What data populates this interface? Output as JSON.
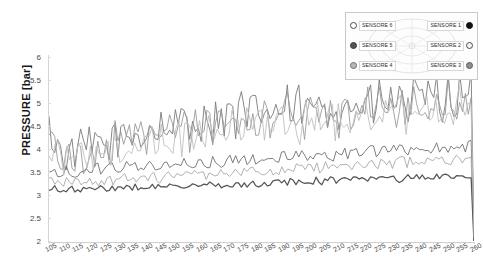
{
  "chart_data": {
    "type": "line",
    "title": "",
    "xlabel": "",
    "ylabel": "PRESSURE [bar]",
    "ylim": [
      2,
      6
    ],
    "xlim": [
      105,
      260
    ],
    "grid": false,
    "legend_position": "top-right",
    "ytick_labels": [
      "6",
      "5.5",
      "5",
      "4.5",
      "4",
      "3.5",
      "3",
      "2.5",
      "2"
    ],
    "ytick_values": [
      6,
      5.5,
      5,
      4.5,
      4,
      3.5,
      3,
      2.5,
      2
    ],
    "xtick_labels": [
      "105",
      "110",
      "115",
      "120",
      "125",
      "130",
      "135",
      "140",
      "145",
      "150",
      "155",
      "160",
      "165",
      "170",
      "175",
      "180",
      "185",
      "190",
      "195",
      "200",
      "205",
      "210",
      "215",
      "220",
      "225",
      "230",
      "235",
      "240",
      "245",
      "250",
      "255",
      "260"
    ],
    "xtick_values": [
      105,
      110,
      115,
      120,
      125,
      130,
      135,
      140,
      145,
      150,
      155,
      160,
      165,
      170,
      175,
      180,
      185,
      190,
      195,
      200,
      205,
      210,
      215,
      220,
      225,
      230,
      235,
      240,
      245,
      250,
      255,
      260
    ],
    "series": [
      {
        "name": "SENSORE 1",
        "color": "#7a7a7a",
        "marker": "filled-circle-black",
        "values": [
          4.42,
          4.3,
          4.18,
          4.05,
          3.96,
          3.9,
          3.86,
          3.84,
          3.88,
          3.96,
          4.06,
          4.02,
          3.94,
          4.0,
          4.12,
          4.04,
          3.96,
          4.06,
          4.18,
          4.1,
          3.98,
          4.06,
          4.2,
          4.34,
          4.22,
          4.1,
          4.24,
          4.4,
          4.3,
          4.16,
          4.28,
          4.46,
          4.34,
          4.2,
          4.36,
          4.52,
          4.4,
          4.26,
          4.42,
          4.58,
          4.44,
          4.3,
          4.48,
          4.64,
          4.5,
          4.36,
          4.54,
          4.7,
          4.56,
          4.4,
          4.58,
          4.76,
          4.62,
          4.46,
          4.64,
          4.82,
          4.66,
          4.5,
          4.68,
          4.86,
          4.7,
          4.54,
          4.72,
          4.9,
          4.74,
          4.56,
          4.74,
          4.92,
          4.76,
          4.58,
          4.76,
          4.94,
          4.78,
          4.6,
          4.78,
          4.96,
          4.8,
          4.62,
          4.8,
          4.98,
          4.82,
          4.64,
          4.82,
          5.0,
          4.84,
          4.66,
          4.84,
          5.02,
          4.86,
          4.68,
          4.86,
          5.04,
          4.88,
          4.7,
          4.88,
          5.06,
          4.9,
          4.72,
          4.9,
          5.08,
          4.92,
          4.74,
          4.92,
          5.1,
          4.94,
          4.76,
          4.94,
          5.12,
          4.96,
          4.78,
          4.96,
          5.14,
          4.98,
          4.8,
          4.98,
          5.16,
          5.0,
          4.82,
          5.0,
          5.18,
          5.02,
          4.84,
          5.02,
          5.2,
          5.04,
          4.86,
          5.04,
          5.22,
          5.06,
          4.88,
          5.06,
          5.24,
          5.08,
          4.9,
          5.08,
          5.26,
          5.1,
          4.92,
          5.1,
          5.28,
          5.12,
          4.94,
          5.12,
          5.3,
          5.14,
          4.96,
          5.14,
          5.32,
          2.05
        ]
      },
      {
        "name": "SENSORE 2",
        "color": "#9b9b9b",
        "marker": "open-circle",
        "values": [
          4.3,
          4.18,
          4.06,
          3.95,
          3.86,
          3.8,
          3.78,
          3.76,
          3.8,
          3.88,
          3.96,
          3.92,
          3.86,
          3.92,
          4.02,
          3.96,
          3.88,
          3.98,
          4.08,
          4.0,
          3.9,
          3.98,
          4.1,
          4.22,
          4.12,
          4.0,
          4.14,
          4.28,
          4.18,
          4.06,
          4.18,
          4.34,
          4.22,
          4.1,
          4.24,
          4.4,
          4.28,
          4.14,
          4.3,
          4.46,
          4.32,
          4.18,
          4.36,
          4.52,
          4.38,
          4.24,
          4.42,
          4.58,
          4.44,
          4.28,
          4.46,
          4.64,
          4.5,
          4.34,
          4.52,
          4.7,
          4.54,
          4.38,
          4.56,
          4.74,
          4.58,
          4.42,
          4.6,
          4.78,
          4.62,
          4.44,
          4.62,
          4.8,
          4.64,
          4.46,
          4.64,
          4.82,
          4.66,
          4.48,
          4.66,
          4.84,
          4.68,
          4.5,
          4.68,
          4.86,
          4.7,
          4.52,
          4.7,
          4.88,
          4.72,
          4.54,
          4.72,
          4.9,
          4.74,
          4.56,
          4.74,
          4.92,
          4.76,
          4.58,
          4.76,
          4.94,
          4.78,
          4.6,
          4.78,
          4.96,
          4.8,
          4.62,
          4.8,
          4.98,
          4.82,
          4.64,
          4.82,
          5.0,
          4.84,
          4.66,
          4.84,
          5.02,
          4.86,
          4.68,
          4.86,
          5.04,
          4.88,
          4.7,
          4.88,
          5.06,
          4.9,
          4.72,
          4.9,
          5.08,
          4.92,
          4.74,
          4.92,
          5.1,
          4.94,
          4.76,
          4.94,
          5.12,
          4.96,
          4.78,
          4.96,
          5.14,
          4.98,
          4.8,
          4.98,
          5.16,
          5.0,
          4.82,
          5.0,
          5.18,
          5.02,
          4.84,
          5.02,
          5.2,
          2.02
        ]
      },
      {
        "name": "SENSORE 3",
        "color": "#6f6f6f",
        "marker": "grey-circle",
        "values": [
          3.58,
          3.56,
          3.54,
          3.52,
          3.5,
          3.5,
          3.52,
          3.54,
          3.52,
          3.5,
          3.52,
          3.54,
          3.56,
          3.54,
          3.52,
          3.54,
          3.56,
          3.58,
          3.56,
          3.54,
          3.56,
          3.58,
          3.6,
          3.58,
          3.56,
          3.58,
          3.6,
          3.62,
          3.6,
          3.58,
          3.6,
          3.62,
          3.64,
          3.62,
          3.6,
          3.62,
          3.64,
          3.66,
          3.64,
          3.62,
          3.64,
          3.66,
          3.68,
          3.66,
          3.64,
          3.66,
          3.68,
          3.7,
          3.68,
          3.66,
          3.68,
          3.7,
          3.72,
          3.7,
          3.68,
          3.7,
          3.72,
          3.74,
          3.72,
          3.7,
          3.72,
          3.74,
          3.76,
          3.74,
          3.72,
          3.74,
          3.76,
          3.78,
          3.76,
          3.74,
          3.76,
          3.78,
          3.8,
          3.78,
          3.76,
          3.78,
          3.8,
          3.82,
          3.8,
          3.78,
          3.8,
          3.82,
          3.84,
          3.82,
          3.8,
          3.82,
          3.84,
          3.86,
          3.84,
          3.82,
          3.84,
          3.86,
          3.88,
          3.86,
          3.84,
          3.86,
          3.88,
          3.9,
          3.88,
          3.86,
          3.88,
          3.9,
          3.92,
          3.9,
          3.88,
          3.9,
          3.92,
          3.94,
          3.92,
          3.9,
          3.92,
          3.94,
          3.96,
          3.94,
          3.92,
          3.94,
          3.96,
          3.98,
          3.96,
          3.94,
          3.96,
          3.98,
          4.0,
          3.98,
          3.96,
          3.98,
          4.0,
          4.02,
          4.0,
          3.98,
          4.0,
          4.02,
          4.04,
          4.02,
          4.0,
          4.02,
          4.04,
          4.06,
          4.04,
          4.02,
          4.04,
          4.06,
          4.08,
          4.06,
          4.04,
          4.06,
          4.08,
          4.1,
          2.0
        ]
      },
      {
        "name": "SENSORE 4",
        "color": "#a8a8a8",
        "marker": "grey-circle",
        "values": [
          3.3,
          3.28,
          3.26,
          3.24,
          3.24,
          3.26,
          3.28,
          3.26,
          3.24,
          3.26,
          3.28,
          3.3,
          3.28,
          3.26,
          3.28,
          3.3,
          3.32,
          3.3,
          3.28,
          3.3,
          3.32,
          3.34,
          3.32,
          3.3,
          3.32,
          3.34,
          3.36,
          3.34,
          3.32,
          3.34,
          3.36,
          3.38,
          3.36,
          3.34,
          3.36,
          3.38,
          3.4,
          3.38,
          3.36,
          3.38,
          3.4,
          3.42,
          3.4,
          3.38,
          3.4,
          3.42,
          3.44,
          3.42,
          3.4,
          3.42,
          3.44,
          3.46,
          3.44,
          3.42,
          3.44,
          3.46,
          3.48,
          3.46,
          3.44,
          3.46,
          3.48,
          3.5,
          3.48,
          3.46,
          3.48,
          3.5,
          3.52,
          3.5,
          3.48,
          3.5,
          3.52,
          3.54,
          3.52,
          3.5,
          3.52,
          3.54,
          3.56,
          3.54,
          3.52,
          3.54,
          3.56,
          3.58,
          3.56,
          3.54,
          3.56,
          3.58,
          3.6,
          3.58,
          3.56,
          3.58,
          3.6,
          3.62,
          3.6,
          3.58,
          3.6,
          3.62,
          3.64,
          3.62,
          3.6,
          3.62,
          3.64,
          3.66,
          3.64,
          3.62,
          3.64,
          3.66,
          3.68,
          3.66,
          3.64,
          3.66,
          3.68,
          3.7,
          3.68,
          3.66,
          3.68,
          3.7,
          3.72,
          3.7,
          3.68,
          3.7,
          3.72,
          3.74,
          3.72,
          3.7,
          3.72,
          3.74,
          3.76,
          3.74,
          3.72,
          3.74,
          3.76,
          3.78,
          3.76,
          3.74,
          3.76,
          3.78,
          3.8,
          3.78,
          3.76,
          3.78,
          3.8,
          3.82,
          3.8,
          3.78,
          3.8,
          3.82,
          1.98
        ]
      },
      {
        "name": "SENSORE 5",
        "color": "#555555",
        "marker": "filled-dark-circle",
        "values": [
          3.1,
          3.12,
          3.14,
          3.12,
          3.1,
          3.08,
          3.1,
          3.12,
          3.14,
          3.12,
          3.1,
          3.12,
          3.14,
          3.12,
          3.1,
          3.12,
          3.14,
          3.16,
          3.14,
          3.12,
          3.14,
          3.16,
          3.14,
          3.12,
          3.14,
          3.16,
          3.18,
          3.16,
          3.14,
          3.16,
          3.18,
          3.16,
          3.14,
          3.16,
          3.18,
          3.2,
          3.18,
          3.16,
          3.18,
          3.2,
          3.18,
          3.16,
          3.18,
          3.2,
          3.22,
          3.2,
          3.18,
          3.2,
          3.22,
          3.2,
          3.18,
          3.2,
          3.22,
          3.24,
          3.22,
          3.2,
          3.22,
          3.24,
          3.22,
          3.2,
          3.22,
          3.24,
          3.26,
          3.24,
          3.22,
          3.24,
          3.26,
          3.24,
          3.22,
          3.24,
          3.26,
          3.28,
          3.26,
          3.24,
          3.26,
          3.28,
          3.26,
          3.24,
          3.26,
          3.28,
          3.3,
          3.28,
          3.26,
          3.28,
          3.3,
          3.28,
          3.26,
          3.28,
          3.3,
          3.32,
          3.3,
          3.28,
          3.3,
          3.32,
          3.3,
          3.28,
          3.3,
          3.32,
          3.34,
          3.32,
          3.3,
          3.32,
          3.34,
          3.32,
          3.3,
          3.32,
          3.34,
          3.36,
          3.34,
          3.32,
          3.34,
          3.36,
          3.34,
          3.32,
          3.34,
          3.36,
          3.38,
          3.36,
          3.34,
          3.36,
          3.38,
          3.36,
          3.34,
          3.36,
          3.38,
          3.4,
          3.38,
          3.36,
          3.38,
          3.4,
          3.38,
          3.36,
          3.38,
          3.4,
          3.42,
          3.4,
          3.38,
          3.4,
          3.42,
          3.4,
          3.38,
          3.4,
          3.42,
          3.44,
          3.42,
          3.4,
          3.42,
          3.44,
          1.96
        ]
      },
      {
        "name": "SENSORE 6",
        "color": "#c0c0c0",
        "marker": "open-circle",
        "values": [
          4.1,
          4.02,
          3.92,
          3.84,
          3.78,
          3.74,
          3.72,
          3.72,
          3.76,
          3.82,
          3.9,
          3.86,
          3.8,
          3.86,
          3.94,
          3.88,
          3.82,
          3.9,
          3.98,
          3.92,
          3.84,
          3.9,
          4.0,
          4.1,
          4.02,
          3.92,
          4.04,
          4.16,
          4.08,
          3.98,
          4.08,
          4.22,
          4.12,
          4.02,
          4.14,
          4.28,
          4.18,
          4.06,
          4.2,
          4.34,
          4.22,
          4.1,
          4.26,
          4.4,
          4.28,
          4.16,
          4.32,
          4.46,
          4.34,
          4.2,
          4.36,
          4.52,
          4.4,
          4.26,
          4.42,
          4.58,
          4.44,
          4.3,
          4.46,
          4.62,
          4.48,
          4.32,
          4.5,
          4.66,
          4.52,
          4.34,
          4.52,
          4.68,
          4.54,
          4.36,
          4.54,
          4.7,
          4.56,
          4.38,
          4.56,
          4.72,
          4.58,
          4.4,
          4.58,
          4.74,
          4.6,
          4.42,
          4.6,
          4.76,
          4.62,
          4.44,
          4.62,
          4.78,
          4.64,
          4.46,
          4.64,
          4.8,
          4.66,
          4.48,
          4.66,
          4.82,
          4.68,
          4.5,
          4.68,
          4.84,
          4.7,
          4.52,
          4.7,
          4.86,
          4.72,
          4.54,
          4.72,
          4.88,
          4.74,
          4.56,
          4.74,
          4.9,
          4.76,
          4.58,
          4.76,
          4.92,
          4.78,
          4.6,
          4.78,
          4.94,
          4.8,
          4.62,
          4.8,
          4.96,
          4.82,
          4.64,
          4.82,
          4.98,
          4.84,
          4.66,
          4.84,
          5.0,
          4.86,
          4.68,
          4.86,
          5.02,
          4.88,
          4.7,
          4.88,
          5.04,
          4.9,
          4.72,
          4.9,
          5.06,
          2.08
        ]
      }
    ]
  },
  "legend": {
    "rows": [
      {
        "left": {
          "label": "SENSORE 6",
          "marker_color": "#ffffff",
          "marker_border": "#4c4c4c"
        },
        "right": {
          "label": "SENSORE 1",
          "marker_color": "#111111",
          "marker_border": "#111111"
        }
      },
      {
        "left": {
          "label": "SENSORE 5",
          "marker_color": "#555555",
          "marker_border": "#3a3a3a"
        },
        "right": {
          "label": "SENSORE 2",
          "marker_color": "#f2f2f2",
          "marker_border": "#4c4c4c"
        }
      },
      {
        "left": {
          "label": "SENSORE 4",
          "marker_color": "#b8b8b8",
          "marker_border": "#6f6f6f"
        },
        "right": {
          "label": "SENSORE 3",
          "marker_color": "#8f8f8f",
          "marker_border": "#5a5a5a"
        }
      }
    ]
  }
}
